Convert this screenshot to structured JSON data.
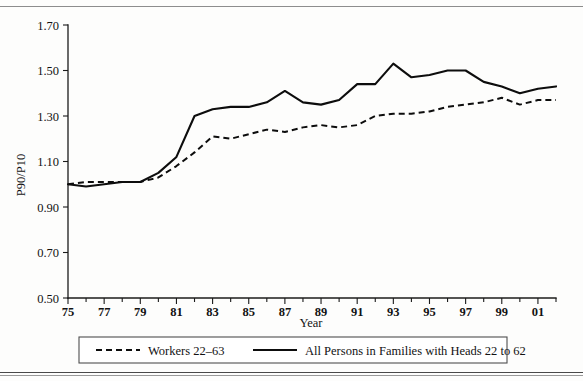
{
  "figure": {
    "background_color": "#fdfdfc",
    "ink_color": "#0d0d0d"
  },
  "chart_data": {
    "type": "line",
    "title": "",
    "xlabel": "Year",
    "ylabel": "P90/P10",
    "xlim": [
      1975,
      2002
    ],
    "ylim": [
      0.5,
      1.7
    ],
    "grid": false,
    "legend_position": "bottom",
    "x": [
      1975,
      1976,
      1977,
      1978,
      1979,
      1980,
      1981,
      1982,
      1983,
      1984,
      1985,
      1986,
      1987,
      1988,
      1989,
      1990,
      1991,
      1992,
      1993,
      1994,
      1995,
      1996,
      1997,
      1998,
      1999,
      2000,
      2001,
      2002
    ],
    "xtick_values": [
      1975,
      1977,
      1979,
      1981,
      1983,
      1985,
      1987,
      1989,
      1991,
      1993,
      1995,
      1997,
      1999,
      2001
    ],
    "xtick_labels": [
      "75",
      "77",
      "79",
      "81",
      "83",
      "85",
      "87",
      "89",
      "91",
      "93",
      "95",
      "97",
      "99",
      "01"
    ],
    "ytick_values": [
      0.5,
      0.7,
      0.9,
      1.1,
      1.3,
      1.5,
      1.7
    ],
    "ytick_labels": [
      "0.50",
      "0.70",
      "0.90",
      "1.10",
      "1.30",
      "1.50",
      "1.70"
    ],
    "series": [
      {
        "name": "Workers 22–63",
        "style": "dashed",
        "values": [
          1.0,
          1.01,
          1.01,
          1.01,
          1.01,
          1.03,
          1.08,
          1.14,
          1.21,
          1.2,
          1.22,
          1.24,
          1.23,
          1.25,
          1.26,
          1.25,
          1.26,
          1.3,
          1.31,
          1.31,
          1.32,
          1.34,
          1.35,
          1.36,
          1.38,
          1.35,
          1.37,
          1.37
        ]
      },
      {
        "name": "All Persons in Families with Heads 22 to 62",
        "style": "solid",
        "values": [
          1.0,
          0.99,
          1.0,
          1.01,
          1.01,
          1.05,
          1.12,
          1.3,
          1.33,
          1.34,
          1.34,
          1.36,
          1.41,
          1.36,
          1.35,
          1.37,
          1.44,
          1.44,
          1.53,
          1.47,
          1.48,
          1.5,
          1.5,
          1.45,
          1.43,
          1.4,
          1.42,
          1.43
        ]
      }
    ]
  },
  "legend": {
    "entries": [
      {
        "label": "Workers 22–63",
        "style": "dashed"
      },
      {
        "label": "All Persons in Families with Heads 22 to 62",
        "style": "solid"
      }
    ]
  }
}
